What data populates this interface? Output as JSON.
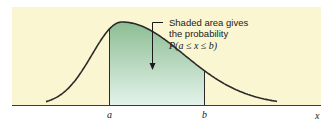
{
  "diagram": {
    "annotation": {
      "line1": "Shaded area gives",
      "line2": "the probability",
      "line3": "P(a ≤ x ≤ b)"
    },
    "axis": {
      "variable_label": "x",
      "tick_labels": [
        "a",
        "b"
      ]
    },
    "colors": {
      "panel_background": "#fbf6d2",
      "shade_top": "#8dbd93",
      "shade_bottom": "#e3f3ea",
      "curve": "#2a2a2a",
      "axis": "#3a3a3a"
    }
  }
}
